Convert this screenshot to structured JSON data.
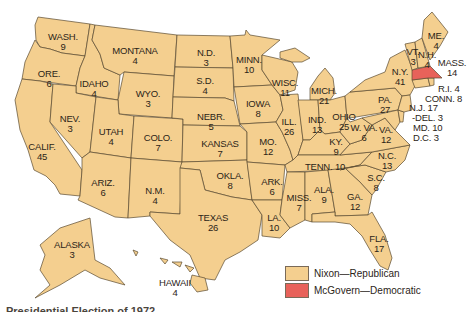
{
  "map": {
    "title_partial": "Presidential Election of 1972",
    "colors": {
      "republican": "#f4cf8f",
      "democratic": "#e8625a",
      "border": "#5a4a30"
    },
    "legend": [
      {
        "label": "Nixon—Republican",
        "color": "#f4cf8f"
      },
      {
        "label": "McGovern—Democratic",
        "color": "#e8625a"
      }
    ],
    "states": [
      {
        "name": "WASH.",
        "votes": "9"
      },
      {
        "name": "ORE.",
        "votes": "6"
      },
      {
        "name": "CALIF.",
        "votes": "45"
      },
      {
        "name": "IDAHO",
        "votes": "4"
      },
      {
        "name": "NEV.",
        "votes": "3"
      },
      {
        "name": "MONTANA",
        "votes": "4"
      },
      {
        "name": "WYO.",
        "votes": "3"
      },
      {
        "name": "UTAH",
        "votes": "4"
      },
      {
        "name": "ARIZ.",
        "votes": "6"
      },
      {
        "name": "COLO.",
        "votes": "7"
      },
      {
        "name": "N.M.",
        "votes": "4"
      },
      {
        "name": "N.D.",
        "votes": "3"
      },
      {
        "name": "S.D.",
        "votes": "4"
      },
      {
        "name": "NEBR.",
        "votes": "5"
      },
      {
        "name": "KANSAS",
        "votes": "7"
      },
      {
        "name": "OKLA.",
        "votes": "8"
      },
      {
        "name": "TEXAS",
        "votes": "26"
      },
      {
        "name": "MINN.",
        "votes": "10"
      },
      {
        "name": "IOWA",
        "votes": "8"
      },
      {
        "name": "MO.",
        "votes": "12"
      },
      {
        "name": "ARK.",
        "votes": "6"
      },
      {
        "name": "LA.",
        "votes": "10"
      },
      {
        "name": "WISC.",
        "votes": "11"
      },
      {
        "name": "ILL.",
        "votes": "26"
      },
      {
        "name": "MICH.",
        "votes": "21"
      },
      {
        "name": "IND.",
        "votes": "13"
      },
      {
        "name": "OHIO",
        "votes": "25"
      },
      {
        "name": "KY.",
        "votes": "9"
      },
      {
        "name": "TENN.",
        "votes": "10"
      },
      {
        "name": "MISS.",
        "votes": "7"
      },
      {
        "name": "ALA.",
        "votes": "9"
      },
      {
        "name": "GA.",
        "votes": "12"
      },
      {
        "name": "FLA.",
        "votes": "17"
      },
      {
        "name": "S.C.",
        "votes": "8"
      },
      {
        "name": "N.C.",
        "votes": "13"
      },
      {
        "name": "VA.",
        "votes": "12"
      },
      {
        "name": "W. VA.",
        "votes": "6"
      },
      {
        "name": "PA.",
        "votes": "27"
      },
      {
        "name": "N.Y.",
        "votes": "41"
      },
      {
        "name": "VT.",
        "votes": "3"
      },
      {
        "name": "N.H.",
        "votes": "4"
      },
      {
        "name": "ME.",
        "votes": "4"
      },
      {
        "name": "MASS.",
        "votes": "14",
        "winner": "McGovern"
      },
      {
        "name": "R.I.",
        "votes": "4"
      },
      {
        "name": "CONN.",
        "votes": "8"
      },
      {
        "name": "N.J.",
        "votes": "17"
      },
      {
        "name": "DEL.",
        "votes": "3"
      },
      {
        "name": "MD.",
        "votes": "10"
      },
      {
        "name": "D.C.",
        "votes": "3",
        "winner": "McGovern"
      },
      {
        "name": "ALASKA",
        "votes": "3"
      },
      {
        "name": "HAWAII",
        "votes": "4"
      }
    ]
  }
}
